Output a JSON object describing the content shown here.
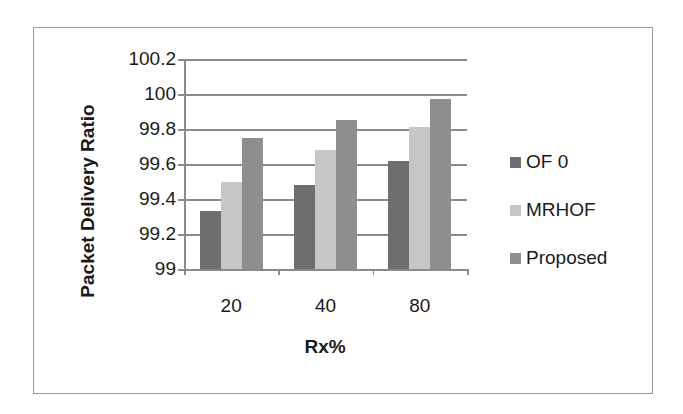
{
  "chart_data": {
    "type": "bar",
    "title": "",
    "xlabel": "Rx%",
    "ylabel": "Packet Delivery Ratio",
    "categories": [
      "20",
      "40",
      "80"
    ],
    "series": [
      {
        "name": "OF 0",
        "color": "#6e6e6e",
        "values": [
          99.33,
          99.48,
          99.62
        ]
      },
      {
        "name": "MRHOF",
        "color": "#c6c6c6",
        "values": [
          99.5,
          99.68,
          99.81
        ]
      },
      {
        "name": "Proposed",
        "color": "#8e8e8e",
        "values": [
          99.75,
          99.85,
          99.97
        ]
      }
    ],
    "ylim": [
      99,
      100.2
    ],
    "yticks": [
      "99",
      "99.2",
      "99.4",
      "99.6",
      "99.8",
      "100",
      "100.2"
    ],
    "grid": true,
    "legend_position": "right"
  }
}
